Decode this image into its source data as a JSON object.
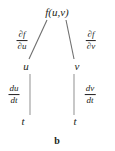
{
  "figure": {
    "caption": "b",
    "type": "tree-diagram"
  },
  "nodes": {
    "root": {
      "label": "f(u,v)",
      "x": 57,
      "y": 12
    },
    "left_mid": {
      "label": "u",
      "x": 26,
      "y": 66
    },
    "right_mid": {
      "label": "v",
      "x": 77,
      "y": 66
    },
    "left_leaf": {
      "label": "t",
      "x": 23,
      "y": 121
    },
    "right_leaf": {
      "label": "t",
      "x": 75,
      "y": 121
    }
  },
  "edge_labels": {
    "root_to_u": {
      "numerator": "∂f",
      "denominator": "∂u",
      "x": 22,
      "y": 41
    },
    "root_to_v": {
      "numerator": "∂f",
      "denominator": "∂v",
      "x": 91,
      "y": 41
    },
    "u_to_t": {
      "numerator": "du",
      "denominator": "dt",
      "x": 14,
      "y": 95
    },
    "v_to_t": {
      "numerator": "dv",
      "denominator": "dt",
      "x": 90,
      "y": 95
    }
  },
  "colors": {
    "background": "#ffffff",
    "ink": "#231f20",
    "line": "#6f6f6f"
  }
}
